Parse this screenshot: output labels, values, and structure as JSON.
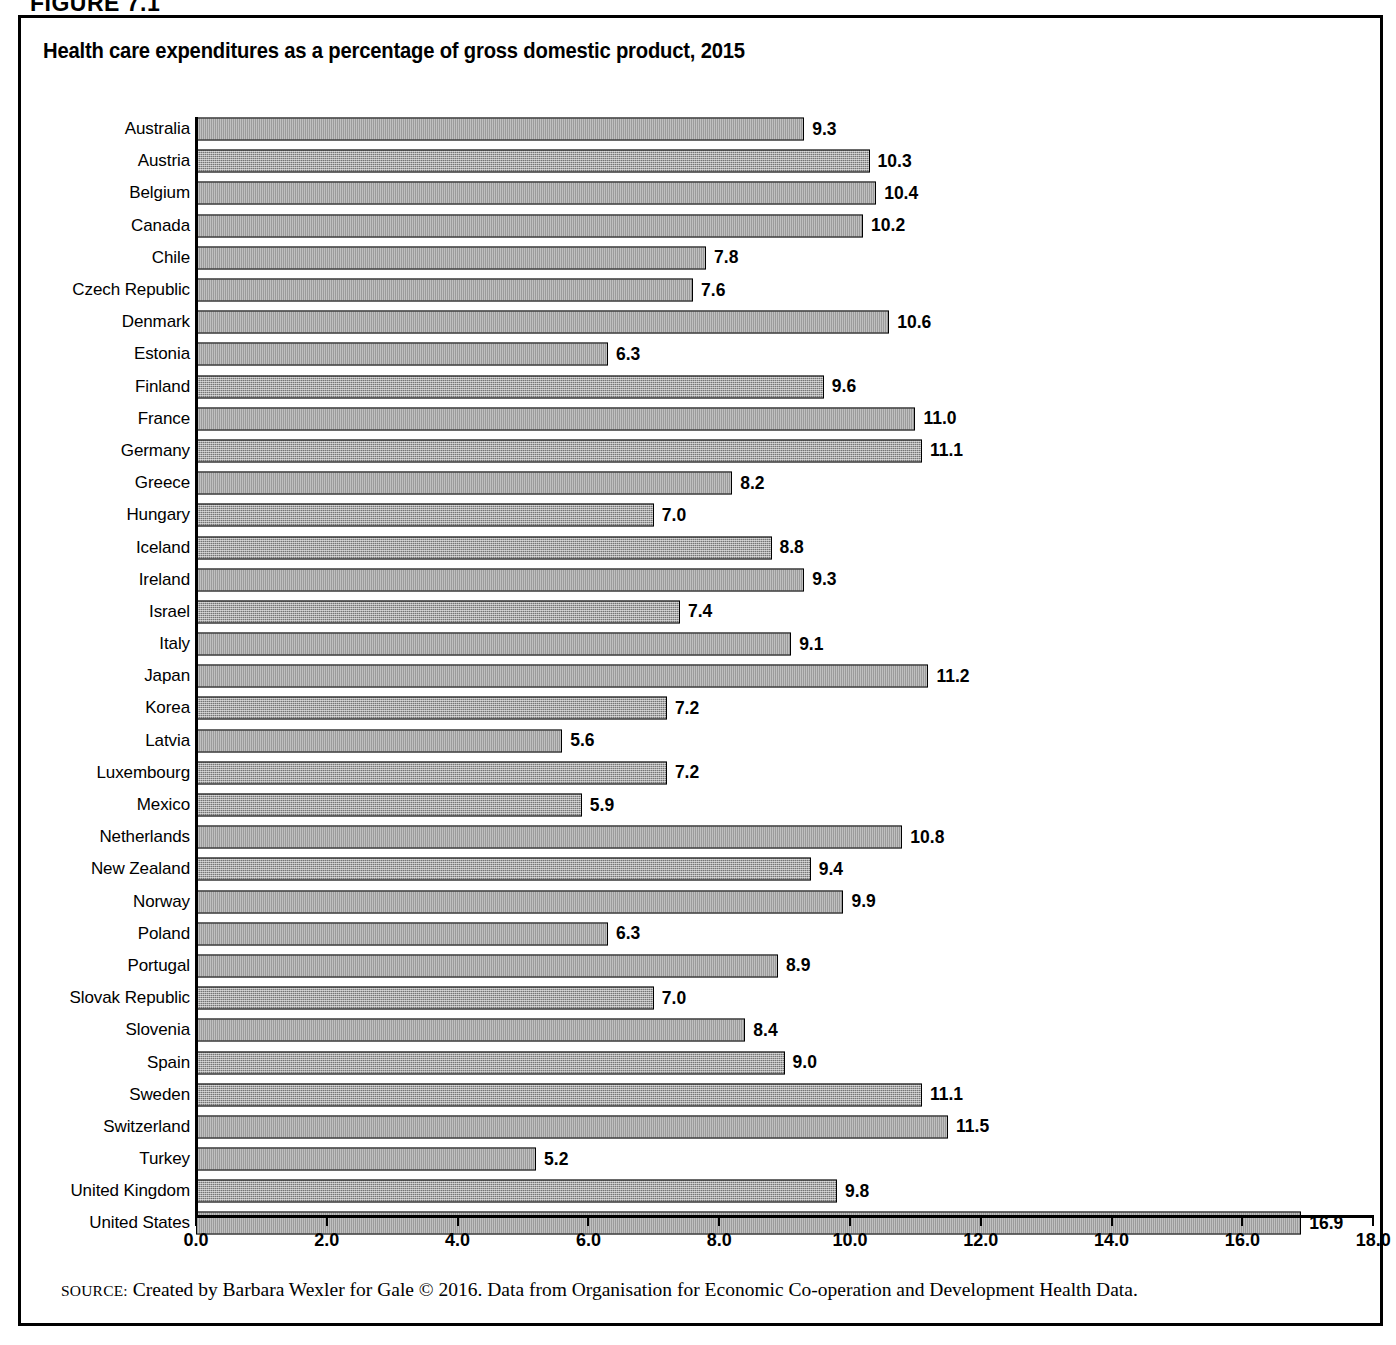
{
  "figure": {
    "label": "FIGURE 7.1",
    "title": "Health care expenditures as a percentage of gross domestic product, 2015",
    "source_keyword": "SOURCE:",
    "source_text": "Created by Barbara Wexler for Gale © 2016. Data from Organisation for Economic Co-operation and Development Health Data."
  },
  "colors": {
    "frame": "#000000",
    "bar_fill": "#a8a8a8",
    "bar_border": "#000000",
    "text": "#000000"
  },
  "chart_data": {
    "type": "bar",
    "orientation": "horizontal",
    "title": "Health care expenditures as a percentage of gross domestic product, 2015",
    "xlabel": "",
    "ylabel": "",
    "xlim": [
      0.0,
      18.0
    ],
    "xticks": [
      "0.0",
      "2.0",
      "4.0",
      "6.0",
      "8.0",
      "10.0",
      "12.0",
      "14.0",
      "16.0",
      "18.0"
    ],
    "xtick_values": [
      0,
      2,
      4,
      6,
      8,
      10,
      12,
      14,
      16,
      18
    ],
    "grid": false,
    "legend": null,
    "value_label_format": "one-decimal",
    "categories": [
      "Australia",
      "Austria",
      "Belgium",
      "Canada",
      "Chile",
      "Czech Republic",
      "Denmark",
      "Estonia",
      "Finland",
      "France",
      "Germany",
      "Greece",
      "Hungary",
      "Iceland",
      "Ireland",
      "Israel",
      "Italy",
      "Japan",
      "Korea",
      "Latvia",
      "Luxembourg",
      "Mexico",
      "Netherlands",
      "New Zealand",
      "Norway",
      "Poland",
      "Portugal",
      "Slovak Republic",
      "Slovenia",
      "Spain",
      "Sweden",
      "Switzerland",
      "Turkey",
      "United Kingdom",
      "United States"
    ],
    "values": [
      9.3,
      10.3,
      10.4,
      10.2,
      7.8,
      7.6,
      10.6,
      6.3,
      9.6,
      11.0,
      11.1,
      8.2,
      7.0,
      8.8,
      9.3,
      7.4,
      9.1,
      11.2,
      7.2,
      5.6,
      7.2,
      5.9,
      10.8,
      9.4,
      9.9,
      6.3,
      8.9,
      7.0,
      8.4,
      9.0,
      11.1,
      11.5,
      5.2,
      9.8,
      16.9
    ],
    "value_labels": [
      "9.3",
      "10.3",
      "10.4",
      "10.2",
      "7.8",
      "7.6",
      "10.6",
      "6.3",
      "9.6",
      "11.0",
      "11.1",
      "8.2",
      "7.0",
      "8.8",
      "9.3",
      "7.4",
      "9.1",
      "11.2",
      "7.2",
      "5.6",
      "7.2",
      "5.9",
      "10.8",
      "9.4",
      "9.9",
      "6.3",
      "8.9",
      "7.0",
      "8.4",
      "9.0",
      "11.1",
      "11.5",
      "5.2",
      "9.8",
      "16.9"
    ]
  }
}
